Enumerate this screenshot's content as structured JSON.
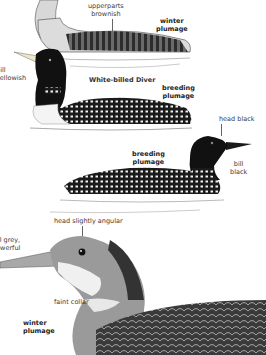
{
  "illustrations": [
    {
      "id": "top-winter",
      "labels": {
        "upperparts": "upperparts",
        "upperparts_2": "brownish",
        "plumage_1": "winter",
        "plumage_2": "plumage"
      }
    },
    {
      "id": "white-billed-breeding",
      "labels": {
        "bill_1": "bill",
        "bill_2": "yellowish",
        "species": "White-billed Diver",
        "plumage_1": "breeding",
        "plumage_2": "plumage"
      }
    },
    {
      "id": "great-northern-breeding",
      "labels": {
        "head": "head black",
        "plumage_1": "breeding",
        "plumage_2": "plumage",
        "bill_1": "bill",
        "bill_2": "black"
      }
    },
    {
      "id": "great-northern-winter-closeup",
      "labels": {
        "head": "head slightly angular",
        "bill_1": "bill grey,",
        "bill_2": "powerful",
        "collar": "faint collar",
        "plumage_1": "winter",
        "plumage_2": "plumage"
      }
    }
  ]
}
